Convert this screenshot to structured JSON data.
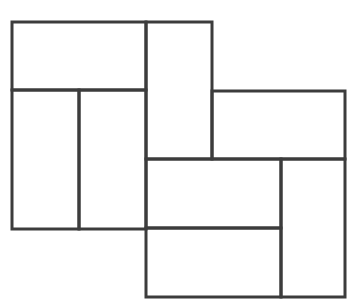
{
  "diagram": {
    "title": "",
    "stroke_color": "#3c3c3c",
    "stroke_width": 3,
    "background": "#ffffff",
    "rectangles": [
      {
        "name": "top-left-wide",
        "x": 12,
        "y": 22,
        "w": 134,
        "h": 68
      },
      {
        "name": "left-lower-a",
        "x": 12,
        "y": 90,
        "w": 67,
        "h": 139
      },
      {
        "name": "left-lower-b",
        "x": 79,
        "y": 90,
        "w": 67,
        "h": 139
      },
      {
        "name": "center-tall",
        "x": 146,
        "y": 22,
        "w": 66,
        "h": 137
      },
      {
        "name": "right-wide",
        "x": 212,
        "y": 91,
        "w": 133,
        "h": 68
      },
      {
        "name": "lower-wide-top",
        "x": 146,
        "y": 159,
        "w": 135,
        "h": 69
      },
      {
        "name": "lower-wide-bottom",
        "x": 146,
        "y": 228,
        "w": 135,
        "h": 69
      },
      {
        "name": "lower-right-tall",
        "x": 281,
        "y": 159,
        "w": 64,
        "h": 138
      }
    ]
  }
}
